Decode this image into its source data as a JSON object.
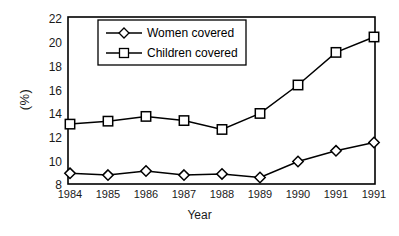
{
  "chart_data": {
    "type": "line",
    "title": "",
    "xlabel": "Year",
    "ylabel": "(%)",
    "categories": [
      "1984",
      "1985",
      "1986",
      "1987",
      "1988",
      "1989",
      "1990",
      "1991",
      "1991"
    ],
    "ylim": [
      8,
      22
    ],
    "yticks": [
      "8",
      "10",
      "12",
      "14",
      "16",
      "18",
      "20",
      "22"
    ],
    "grid": false,
    "legend_position": "top-left-inside",
    "series": [
      {
        "name": "Women covered",
        "marker": "diamond",
        "values": [
          8.9,
          8.75,
          9.1,
          8.75,
          8.85,
          8.55,
          9.9,
          10.8,
          11.5
        ]
      },
      {
        "name": "Children covered",
        "marker": "square",
        "values": [
          13.05,
          13.3,
          13.7,
          13.35,
          12.6,
          13.95,
          16.35,
          19.1,
          20.4
        ]
      }
    ]
  },
  "legend": {
    "items": [
      {
        "label": "Women covered"
      },
      {
        "label": "Children covered"
      }
    ]
  },
  "colors": {
    "line": "#000000",
    "marker_fill": "#ffffff",
    "axis": "#000000",
    "background": "#ffffff"
  }
}
